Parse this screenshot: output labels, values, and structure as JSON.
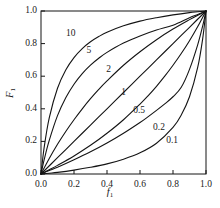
{
  "chart_data": {
    "type": "line",
    "title": "",
    "xlabel": "f1",
    "ylabel": "F1",
    "xlim": [
      0.0,
      1.0
    ],
    "ylim": [
      0.0,
      1.0
    ],
    "grid": false,
    "legend_position": "inline-curve-labels",
    "x_ticks": [
      "0.0",
      "0.2",
      "0.4",
      "0.6",
      "0.8",
      "1.0"
    ],
    "x_tick_values": [
      0.0,
      0.2,
      0.4,
      0.6,
      0.8,
      1.0
    ],
    "y_ticks": [
      "0.0",
      "0.2",
      "0.4",
      "0.6",
      "0.8",
      "1.0"
    ],
    "y_tick_values": [
      0.0,
      0.2,
      0.4,
      0.6,
      0.8,
      1.0
    ],
    "series": [
      {
        "name": "10",
        "parameter": 10,
        "label": "10",
        "label_x": 0.18,
        "label_y": 0.86,
        "x": [
          0.0,
          0.02,
          0.05,
          0.1,
          0.15,
          0.2,
          0.25,
          0.3,
          0.35,
          0.4,
          0.5,
          0.6,
          0.7,
          0.8,
          0.9,
          0.95,
          1.0
        ],
        "y": [
          0.0,
          0.169,
          0.345,
          0.526,
          0.638,
          0.714,
          0.769,
          0.811,
          0.843,
          0.87,
          0.909,
          0.938,
          0.959,
          0.976,
          0.99,
          0.995,
          1.0
        ]
      },
      {
        "name": "5",
        "parameter": 5,
        "label": "5",
        "label_x": 0.29,
        "label_y": 0.755,
        "x": [
          0.0,
          0.02,
          0.05,
          0.1,
          0.15,
          0.2,
          0.25,
          0.3,
          0.35,
          0.4,
          0.5,
          0.6,
          0.7,
          0.8,
          0.9,
          0.95,
          1.0
        ],
        "y": [
          0.0,
          0.091,
          0.206,
          0.358,
          0.468,
          0.551,
          0.616,
          0.668,
          0.71,
          0.746,
          0.803,
          0.847,
          0.883,
          0.913,
          0.959,
          0.979,
          1.0
        ]
      },
      {
        "name": "2",
        "parameter": 2,
        "label": "2",
        "label_x": 0.41,
        "label_y": 0.635,
        "x": [
          0.0,
          0.05,
          0.1,
          0.15,
          0.2,
          0.25,
          0.3,
          0.35,
          0.4,
          0.5,
          0.6,
          0.7,
          0.8,
          0.9,
          0.95,
          1.0
        ],
        "y": [
          0.0,
          0.095,
          0.182,
          0.261,
          0.333,
          0.4,
          0.462,
          0.519,
          0.571,
          0.667,
          0.75,
          0.824,
          0.889,
          0.947,
          0.974,
          1.0
        ]
      },
      {
        "name": "1",
        "parameter": 1,
        "label": "1",
        "label_x": 0.5,
        "label_y": 0.5,
        "x": [
          0.0,
          0.1,
          0.2,
          0.3,
          0.4,
          0.5,
          0.6,
          0.7,
          0.8,
          0.9,
          1.0
        ],
        "y": [
          0.0,
          0.1,
          0.2,
          0.3,
          0.4,
          0.5,
          0.6,
          0.7,
          0.8,
          0.9,
          1.0
        ]
      },
      {
        "name": "0.5",
        "parameter": 0.5,
        "label": "0.5",
        "label_x": 0.595,
        "label_y": 0.385,
        "x": [
          0.0,
          0.05,
          0.1,
          0.2,
          0.3,
          0.4,
          0.5,
          0.6,
          0.65,
          0.7,
          0.75,
          0.8,
          0.85,
          0.9,
          0.95,
          1.0
        ],
        "y": [
          0.0,
          0.026,
          0.053,
          0.111,
          0.176,
          0.25,
          0.333,
          0.429,
          0.481,
          0.538,
          0.6,
          0.667,
          0.739,
          0.818,
          0.905,
          1.0
        ]
      },
      {
        "name": "0.2",
        "parameter": 0.2,
        "label": "0.2",
        "label_x": 0.715,
        "label_y": 0.285,
        "x": [
          0.0,
          0.05,
          0.1,
          0.2,
          0.3,
          0.4,
          0.5,
          0.6,
          0.65,
          0.7,
          0.75,
          0.8,
          0.85,
          0.9,
          0.95,
          0.98,
          1.0
        ],
        "y": [
          0.0,
          0.021,
          0.041,
          0.087,
          0.136,
          0.19,
          0.25,
          0.316,
          0.352,
          0.39,
          0.43,
          0.474,
          0.532,
          0.642,
          0.794,
          0.909,
          1.0
        ]
      },
      {
        "name": "0.1",
        "parameter": 0.1,
        "label": "0.1",
        "label_x": 0.795,
        "label_y": 0.205,
        "x": [
          0.0,
          0.05,
          0.1,
          0.2,
          0.3,
          0.4,
          0.5,
          0.6,
          0.7,
          0.8,
          0.85,
          0.9,
          0.95,
          0.98,
          1.0
        ],
        "y": [
          0.0,
          0.005,
          0.01,
          0.024,
          0.041,
          0.062,
          0.091,
          0.13,
          0.189,
          0.286,
          0.362,
          0.474,
          0.655,
          0.831,
          1.0
        ]
      }
    ]
  }
}
